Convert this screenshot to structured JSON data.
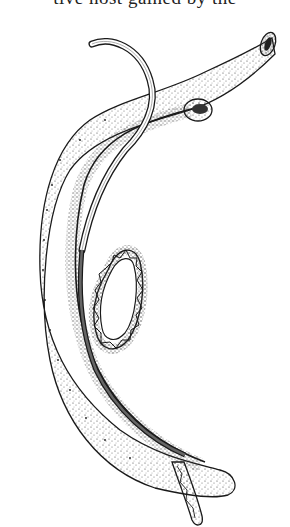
{
  "page": {
    "cropped_text_line": "tive host gained by the"
  },
  "figure": {
    "colors": {
      "ink": "#1a1a1a",
      "paper": "#ffffff",
      "stipple": "#555555"
    }
  }
}
